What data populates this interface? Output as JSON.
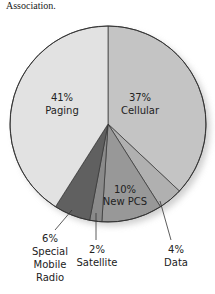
{
  "caption": "Association.",
  "chart_data": {
    "type": "pie",
    "title": "",
    "categories": [
      "Cellular",
      "Data",
      "New PCS",
      "Satellite",
      "Special Mobile Radio",
      "Paging"
    ],
    "values": [
      37,
      4,
      10,
      2,
      6,
      41
    ],
    "labels": [
      "37%",
      "4%",
      "10%",
      "2%",
      "6%",
      "41%"
    ],
    "colors": [
      "#c4c4c4",
      "#b0b0b0",
      "#989898",
      "#8a8a8a",
      "#606060",
      "#e2e2e2"
    ],
    "start_angle_deg": 0,
    "direction": "clockwise",
    "legend": "none (direct labels)"
  },
  "labels": {
    "paging": {
      "pct": "41%",
      "name": "Paging"
    },
    "cellular": {
      "pct": "37%",
      "name": "Cellular"
    },
    "new_pcs": {
      "pct": "10%",
      "name": "New PCS"
    },
    "data": {
      "pct": "4%",
      "name": "Data"
    },
    "satellite": {
      "pct": "2%",
      "name": "Satellite"
    },
    "smr": {
      "pct": "6%",
      "name1": "Special",
      "name2": "Mobile",
      "name3": "Radio"
    }
  }
}
